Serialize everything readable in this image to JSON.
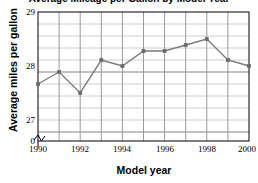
{
  "chart_data": {
    "type": "line",
    "title": "Average Mileage per Gallon by Model Year",
    "xlabel": "Model year",
    "ylabel": "Average miles per gallon",
    "x": [
      1990,
      1991,
      1992,
      1993,
      1994,
      1995,
      1996,
      1997,
      1998,
      1999,
      2000
    ],
    "values": [
      27.8,
      28.0,
      27.65,
      28.2,
      28.1,
      28.35,
      28.35,
      28.45,
      28.55,
      28.2,
      28.1
    ],
    "series": [
      {
        "name": "Average miles per gallon",
        "values": [
          27.8,
          28.0,
          27.65,
          28.2,
          28.1,
          28.35,
          28.35,
          28.45,
          28.55,
          28.2,
          28.1
        ]
      }
    ],
    "xlim": [
      1990,
      2000
    ],
    "ylim": [
      26.85,
      29
    ],
    "ytick_labels": [
      "29",
      "28",
      "27",
      "0"
    ],
    "ytick_values": [
      29,
      28,
      27,
      26.85
    ],
    "xtick_labels": [
      "1990",
      "1992",
      "1994",
      "1996",
      "1998",
      "2000"
    ],
    "xtick_values": [
      1990,
      1992,
      1994,
      1996,
      1998,
      2000
    ],
    "xminor_values": [
      1991,
      1993,
      1995,
      1997,
      1999
    ],
    "grid": true,
    "grid_minor": true,
    "axis_break": true,
    "legend": "none",
    "colors": {
      "line": "#7a7a7a",
      "marker": "#6b6b6b",
      "grid_major": "#9a9a9a",
      "grid_minor": "#d0d0d0",
      "axis": "#000000",
      "background": "#ffffff"
    }
  }
}
